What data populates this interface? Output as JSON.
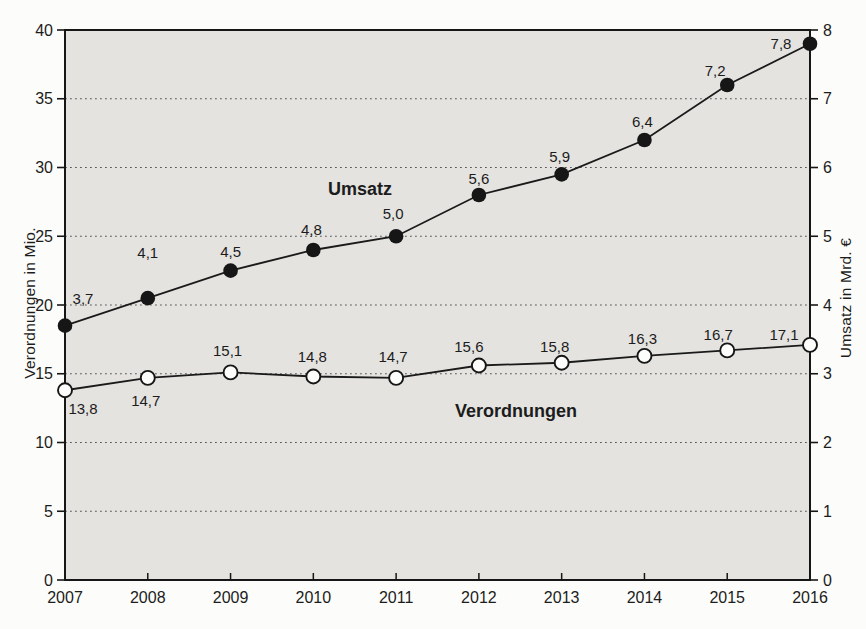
{
  "chart_data": {
    "type": "line",
    "categories": [
      "2007",
      "2008",
      "2009",
      "2010",
      "2011",
      "2012",
      "2013",
      "2014",
      "2015",
      "2016"
    ],
    "series": [
      {
        "name": "Umsatz",
        "axis": "right",
        "marker": "filled-black",
        "values": [
          3.7,
          4.1,
          4.5,
          4.8,
          5.0,
          5.6,
          5.9,
          6.4,
          7.2,
          7.8
        ],
        "point_labels": [
          "3,7",
          "4,1",
          "4,5",
          "4,8",
          "5,0",
          "5,6",
          "5,9",
          "6,4",
          "7,2",
          "7,8"
        ],
        "label_offsets": [
          [
            18,
            -27
          ],
          [
            0,
            -46
          ],
          [
            0,
            -19
          ],
          [
            -2,
            -21
          ],
          [
            -3,
            -23
          ],
          [
            0,
            -17
          ],
          [
            -2,
            -18
          ],
          [
            -2,
            -19
          ],
          [
            -12,
            -15
          ],
          [
            -29,
            0
          ]
        ]
      },
      {
        "name": "Verordnungen",
        "axis": "left",
        "marker": "open-white",
        "values": [
          13.8,
          14.7,
          15.1,
          14.8,
          14.7,
          15.6,
          15.8,
          16.3,
          16.7,
          17.1
        ],
        "point_labels": [
          "13,8",
          "14,7",
          "15,1",
          "14,8",
          "14,7",
          "15,6",
          "15,8",
          "16,3",
          "16,7",
          "17,1"
        ],
        "label_offsets": [
          [
            18,
            18
          ],
          [
            -2,
            23
          ],
          [
            -3,
            -22
          ],
          [
            -1,
            -20
          ],
          [
            -3,
            -21
          ],
          [
            -10,
            -19
          ],
          [
            -7,
            -16
          ],
          [
            -2,
            -17
          ],
          [
            -9,
            -16
          ],
          [
            -26,
            -10
          ]
        ]
      }
    ],
    "left_axis": {
      "title": "Verordnungen in Mio.",
      "min": 0,
      "max": 40,
      "tick_step": 5,
      "tick_labels": [
        "0",
        "5",
        "10",
        "15",
        "20",
        "25",
        "30",
        "35",
        "40"
      ]
    },
    "right_axis": {
      "title": "Umsatz in Mrd. €",
      "min": 0,
      "max": 8,
      "tick_step": 1,
      "tick_labels": [
        "0",
        "1",
        "2",
        "3",
        "4",
        "5",
        "6",
        "7",
        "8"
      ]
    },
    "gridlines_left_values": [
      5,
      10,
      15,
      20,
      25,
      30,
      35
    ],
    "grid_style": "dotted-horizontal",
    "legend_position": "inline-annotations",
    "annotations": [
      {
        "text": "Umsatz",
        "x": 360,
        "y": 189
      },
      {
        "text": "Verordnungen",
        "x": 516,
        "y": 411
      }
    ],
    "colors": {
      "plot_bg": "#e4e3e0",
      "line": "#1a1a1a",
      "grid": "#5a5a5a",
      "frame": "#161616",
      "marker_fill": "#161616",
      "marker_open_fill": "#fdfdfc",
      "text": "#1c1c1c",
      "page_bg": "#fcfcfa"
    }
  },
  "layout": {
    "plot": {
      "left": 65,
      "right": 810,
      "top": 30,
      "bottom": 580
    }
  }
}
